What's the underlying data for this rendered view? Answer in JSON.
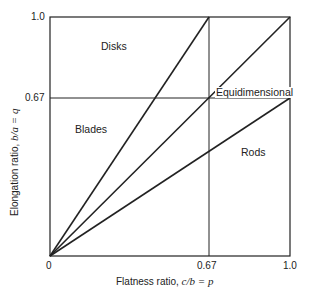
{
  "diagram": {
    "type": "shape-classification",
    "x_axis": {
      "label_text": "Flatness ratio, ",
      "label_math": "c/b = p",
      "ticks": [
        "0",
        "0.67",
        "1.0"
      ],
      "range": [
        0,
        1.0
      ]
    },
    "y_axis": {
      "label_text": "Elongation ratio, ",
      "label_math": "b/a = q",
      "ticks": [
        "0",
        "0.67",
        "1.0"
      ],
      "range": [
        0,
        1.0
      ]
    },
    "regions": {
      "disks": "Disks",
      "blades": "Blades",
      "equidimensional": "Equidimensional",
      "rods": "Rods"
    },
    "divider_lines": [
      {
        "from": [
          0,
          0
        ],
        "to": [
          0.67,
          1.0
        ]
      },
      {
        "from": [
          0,
          0
        ],
        "to": [
          1.0,
          1.0
        ]
      },
      {
        "from": [
          0,
          0
        ],
        "to": [
          1.0,
          0.67
        ]
      }
    ],
    "grid_lines": [
      {
        "orientation": "vertical",
        "at": 0.67
      },
      {
        "orientation": "horizontal",
        "at": 0.67
      }
    ],
    "line_color": "#222222"
  }
}
